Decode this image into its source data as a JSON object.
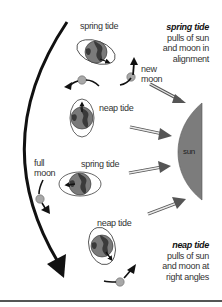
{
  "diagram": {
    "labels": {
      "spring_tide_top": "spring tide",
      "new_moon": "new\nmoon",
      "neap_tide_upper": "neap tide",
      "full_moon": "full\nmoon",
      "spring_tide_middle": "spring tide",
      "neap_tide_lower": "neap tide",
      "sun": "sun"
    },
    "captions": {
      "spring": {
        "title": "spring tide",
        "body": "pulls of sun\nand moon in\nalignment"
      },
      "neap": {
        "title": "neap tide",
        "body": "pulls of sun\nand moon at\nright angles"
      }
    },
    "nodes": [
      {
        "id": "earth-spring-new",
        "kind": "earth",
        "bulge": "horizontal",
        "label": "spring tide"
      },
      {
        "id": "moon-new",
        "kind": "moon",
        "label": "new moon"
      },
      {
        "id": "earth-neap-upper",
        "kind": "earth",
        "bulge": "vertical",
        "label": "neap tide"
      },
      {
        "id": "earth-spring-full",
        "kind": "earth",
        "bulge": "horizontal",
        "label": "spring tide"
      },
      {
        "id": "moon-full",
        "kind": "moon",
        "label": "full moon"
      },
      {
        "id": "earth-neap-lower",
        "kind": "earth",
        "bulge": "vertical",
        "label": "neap tide"
      },
      {
        "id": "sun",
        "kind": "sun",
        "label": "sun"
      }
    ],
    "edges": [
      {
        "from": "moon",
        "to": "moon",
        "kind": "orbit-direction",
        "description": "large curved arrow showing moon's orbit direction (downward)"
      },
      {
        "from": "sun",
        "to": "earth",
        "kind": "sunlight",
        "count": 4
      }
    ],
    "colors": {
      "earth_ocean": "#7a7a7a",
      "earth_land": "#3a3a3a",
      "moon": "#a8a8a8",
      "sun": "#7c7c7c",
      "arrow_fill": "#707070",
      "orbit_arrow": "#111111",
      "rule": "#555555"
    }
  }
}
